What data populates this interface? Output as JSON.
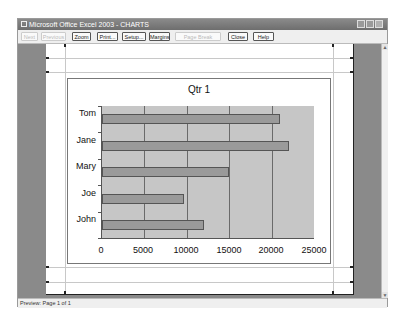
{
  "window": {
    "title": "Microsoft Office Excel 2003 - CHARTS",
    "controls": [
      "minimize",
      "restore",
      "close"
    ]
  },
  "toolbar": {
    "buttons": [
      {
        "label": "Next",
        "enabled": false
      },
      {
        "label": "Previous",
        "enabled": false
      },
      {
        "label": "Zoom",
        "enabled": true
      },
      {
        "label": "Print...",
        "enabled": true
      },
      {
        "label": "Setup...",
        "enabled": true
      },
      {
        "label": "Margins",
        "enabled": true
      },
      {
        "label": "Page Break Preview",
        "enabled": false
      },
      {
        "label": "Close",
        "enabled": true
      },
      {
        "label": "Help",
        "enabled": true
      }
    ]
  },
  "status": {
    "text": "Preview: Page 1 of 1"
  },
  "chart_data": {
    "type": "bar",
    "orientation": "horizontal",
    "title": "Qtr 1",
    "categories": [
      "Tom",
      "Jane",
      "Mary",
      "Joe",
      "John"
    ],
    "values": [
      21000,
      22000,
      15000,
      9700,
      12000
    ],
    "xlabel": "",
    "ylabel": "",
    "xlim": [
      0,
      25000
    ],
    "xticks": [
      "0",
      "5000",
      "10000",
      "15000",
      "20000",
      "25000"
    ],
    "grid": true,
    "legend": null,
    "colors": {
      "bar": "#9a9a9a",
      "plot_bg": "#c6c6c6"
    }
  }
}
